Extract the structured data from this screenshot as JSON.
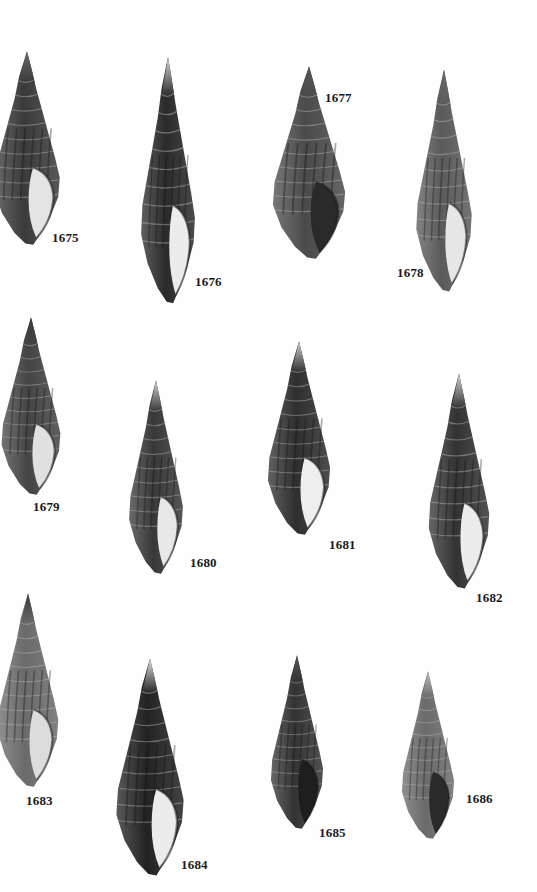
{
  "plate": {
    "background": "#ffffff",
    "specimens": [
      {
        "number": "1675",
        "shell": {
          "x": -12,
          "y": 50,
          "w": 78,
          "h": 196,
          "tone": "#3a3a3a",
          "apex": "#6a6a6a",
          "aperture": "#e4e4e4"
        },
        "label_pos": {
          "x": 52,
          "y": 230
        }
      },
      {
        "number": "1676",
        "shell": {
          "x": 136,
          "y": 55,
          "w": 64,
          "h": 250,
          "tone": "#2a2a2a",
          "apex": "#d8d8d8",
          "aperture": "#ececec"
        },
        "label_pos": {
          "x": 195,
          "y": 274
        }
      },
      {
        "number": "1677",
        "shell": {
          "x": 266,
          "y": 65,
          "w": 86,
          "h": 195,
          "tone": "#4a4a4a",
          "apex": "#555555",
          "aperture": "#2a2a2a"
        },
        "label_pos": {
          "x": 325,
          "y": 90
        }
      },
      {
        "number": "1678",
        "shell": {
          "x": 411,
          "y": 68,
          "w": 66,
          "h": 225,
          "tone": "#5a5a5a",
          "apex": "#6a6a6a",
          "aperture": "#e6e6e6"
        },
        "label_pos": {
          "x": 397,
          "y": 265
        }
      },
      {
        "number": "1679",
        "shell": {
          "x": -4,
          "y": 316,
          "w": 70,
          "h": 180,
          "tone": "#444444",
          "apex": "#3a3a3a",
          "aperture": "#e0e0e0"
        },
        "label_pos": {
          "x": 33,
          "y": 499
        }
      },
      {
        "number": "1680",
        "shell": {
          "x": 124,
          "y": 379,
          "w": 64,
          "h": 196,
          "tone": "#383838",
          "apex": "#d0d0d0",
          "aperture": "#e8e8e8"
        },
        "label_pos": {
          "x": 190,
          "y": 555
        }
      },
      {
        "number": "1681",
        "shell": {
          "x": 262,
          "y": 340,
          "w": 74,
          "h": 196,
          "tone": "#2e2e2e",
          "apex": "#cfcfcf",
          "aperture": "#eeeeee"
        },
        "label_pos": {
          "x": 329,
          "y": 537
        }
      },
      {
        "number": "1682",
        "shell": {
          "x": 423,
          "y": 372,
          "w": 72,
          "h": 218,
          "tone": "#333333",
          "apex": "#d4d4d4",
          "aperture": "#ececec"
        },
        "label_pos": {
          "x": 476,
          "y": 590
        }
      },
      {
        "number": "1683",
        "shell": {
          "x": -8,
          "y": 592,
          "w": 72,
          "h": 196,
          "tone": "#6a6a6a",
          "apex": "#3a3a3a",
          "aperture": "#dcdcdc"
        },
        "label_pos": {
          "x": 26,
          "y": 793
        }
      },
      {
        "number": "1684",
        "shell": {
          "x": 110,
          "y": 657,
          "w": 80,
          "h": 220,
          "tone": "#222222",
          "apex": "#e0e0e0",
          "aperture": "#ececec"
        },
        "label_pos": {
          "x": 181,
          "y": 857
        }
      },
      {
        "number": "1685",
        "shell": {
          "x": 266,
          "y": 654,
          "w": 62,
          "h": 176,
          "tone": "#333333",
          "apex": "#555555",
          "aperture": "#1e1e1e"
        },
        "label_pos": {
          "x": 319,
          "y": 825
        }
      },
      {
        "number": "1686",
        "shell": {
          "x": 397,
          "y": 670,
          "w": 62,
          "h": 170,
          "tone": "#6a6a6a",
          "apex": "#bdbdbd",
          "aperture": "#2a2a2a"
        },
        "label_pos": {
          "x": 466,
          "y": 791
        }
      }
    ]
  }
}
